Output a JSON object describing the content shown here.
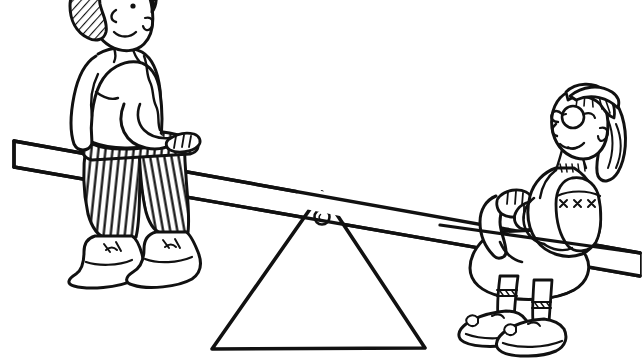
{
  "page": {
    "width": 643,
    "height": 360,
    "background_color": "#ffffff",
    "ink_color": "#111111",
    "style": "black-and-white line art / coloring-book illustration"
  },
  "caption": {
    "text": "Because he can't work any faster.",
    "color": "#1b1b1b",
    "clipped_at_top": true
  },
  "scene": {
    "title": "Two children on a seesaw",
    "elements": [
      "seesaw-plank",
      "triangle-fulcrum",
      "bolt-pivot",
      "boy-left",
      "girl-right"
    ]
  },
  "plank": {
    "name": "seesaw-plank",
    "description": "Long wooden board tilted down to the right",
    "left_end_y": 143,
    "right_end_y": 258,
    "thickness": 22
  },
  "fulcrum": {
    "name": "triangle-fulcrum",
    "description": "Large triangular support under the plank",
    "apex_x": 322,
    "apex_y": 193,
    "base_left_x": 211,
    "base_right_x": 424,
    "base_y": 349,
    "bolt": {
      "name": "bolt-pivot",
      "cx": 322,
      "cy": 217,
      "r": 7
    }
  },
  "children": [
    {
      "name": "boy-left",
      "position": "left, seated high on raised end of plank",
      "hair": "curly, cross-hatched shading",
      "clothing": "short-sleeve t-shirt, vertically striped pants",
      "footwear": "white lace-up sneakers",
      "expression": "smiling profile facing right"
    },
    {
      "name": "girl-right",
      "position": "right, seated low on lowered end of plank",
      "hair": "long straight hair with bangs and a headband",
      "accessories": "round eyeglasses",
      "clothing": "vest with X-stitch trim, skirt, cuffed socks",
      "footwear": "buckled shoes with bow detail",
      "expression": "smiling profile facing left",
      "hands": "gripping the seesaw handle"
    }
  ]
}
